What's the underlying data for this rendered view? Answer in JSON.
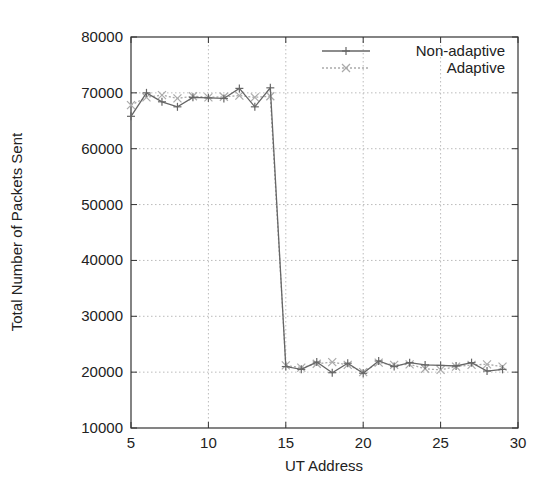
{
  "chart_data": {
    "type": "line",
    "title": "",
    "xlabel": "UT Address",
    "ylabel": "Total Number of Packets Sent",
    "xlim": [
      5,
      30
    ],
    "ylim": [
      10000,
      80000
    ],
    "xticks": [
      5,
      10,
      15,
      20,
      25,
      30
    ],
    "yticks": [
      10000,
      20000,
      30000,
      40000,
      50000,
      60000,
      70000,
      80000
    ],
    "grid": true,
    "legend_position": "top-right",
    "x": [
      5,
      6,
      7,
      8,
      9,
      10,
      11,
      12,
      13,
      14,
      15,
      16,
      17,
      18,
      19,
      20,
      21,
      22,
      23,
      24,
      25,
      26,
      27,
      28,
      29
    ],
    "series": [
      {
        "name": "Non-adaptive",
        "marker": "+",
        "line": "solid",
        "color": "#666666",
        "values": [
          65800,
          70000,
          68400,
          67500,
          69200,
          69100,
          69000,
          70800,
          67500,
          70900,
          21000,
          20500,
          21800,
          19900,
          21600,
          19800,
          22000,
          21000,
          21700,
          21300,
          21200,
          21100,
          21700,
          20200,
          20500
        ]
      },
      {
        "name": "Adaptive",
        "marker": "x",
        "line": "dotted",
        "color": "#aaaaaa",
        "values": [
          67800,
          69200,
          69600,
          69000,
          69400,
          69200,
          69300,
          69500,
          69200,
          69400,
          21200,
          20800,
          21500,
          21800,
          21300,
          20000,
          21700,
          21300,
          21400,
          20600,
          20400,
          21000,
          21300,
          21400,
          21000
        ]
      }
    ]
  }
}
